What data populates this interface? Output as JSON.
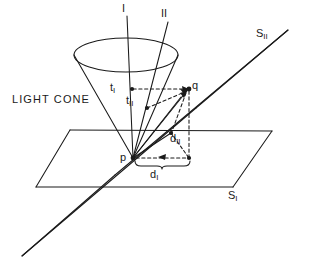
{
  "figure": {
    "background_color": "#ffffff",
    "stroke_color": "#1a1a1a",
    "labels": {
      "light_cone": "LIGHT CONE",
      "axis_one": "I",
      "axis_two": "II",
      "plane_one": "S",
      "plane_one_sub": "I",
      "plane_two": "S",
      "plane_two_sub": "II",
      "time_one": "t",
      "time_one_sub": "I",
      "time_two": "t",
      "time_two_sub": "II",
      "point_p": "p",
      "point_q": "q",
      "dist_one": "d",
      "dist_one_sub": "I",
      "dist_two": "d",
      "dist_two_sub": "II"
    }
  },
  "geometry": {
    "apex_p": [
      133,
      158
    ],
    "event_q": [
      189,
      89
    ],
    "cone_ellipse_center": [
      126,
      55
    ],
    "cone_ellipse_rx": 52,
    "cone_ellipse_ry": 17,
    "axis_I_top": [
      126,
      8
    ],
    "axis_II_top": [
      167,
      20
    ],
    "t_I_mark": [
      132,
      89
    ],
    "t_II_mark": [
      146,
      108
    ],
    "d_I_endpoint": [
      189,
      158
    ],
    "d_II_endpoint": [
      171,
      133
    ]
  }
}
